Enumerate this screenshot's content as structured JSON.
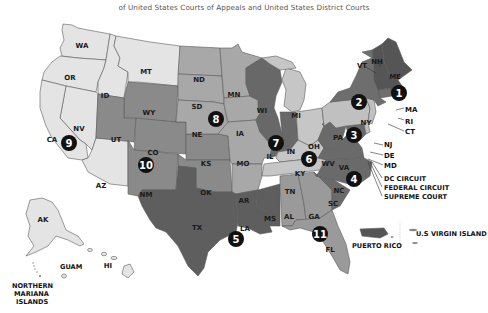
{
  "header": {
    "subtitle": "of United States Courts of Appeals and United States District Courts"
  },
  "colors": {
    "very_light": "#e4e4e4",
    "light": "#c6c6c6",
    "medium": "#9c9c9c",
    "medium_dark": "#7a7a7a",
    "dark": "#5c5c5c",
    "badge": "#111111"
  },
  "states": {
    "WA": "WA",
    "OR": "OR",
    "CA": "CA",
    "NV": "NV",
    "ID": "ID",
    "MT": "MT",
    "AZ": "AZ",
    "WY": "WY",
    "UT": "UT",
    "CO": "CO",
    "NM": "NM",
    "KS": "KS",
    "OK": "OK",
    "ND": "ND",
    "SD": "SD",
    "NE": "NE",
    "MN": "MN",
    "IA": "IA",
    "MO": "MO",
    "AR": "AR",
    "TX": "TX",
    "LA": "LA",
    "MS": "MS",
    "WI": "WI",
    "IL": "IL",
    "IN": "IN",
    "MI": "MI",
    "OH": "OH",
    "KY": "KY",
    "TN": "TN",
    "AL": "AL",
    "GA": "GA",
    "FL": "FL",
    "WV": "WV",
    "VA": "VA",
    "NC": "NC",
    "SC": "SC",
    "MD": "MD",
    "PA": "PA",
    "NJ": "NJ",
    "DE": "DE",
    "NY": "NY",
    "VT": "VT",
    "CT": "CT",
    "ME": "ME",
    "NH": "NH",
    "MA": "MA",
    "RI": "RI",
    "AK": "AK",
    "HI": "HI"
  },
  "territories": {
    "guam": "GUAM",
    "nmi_line1": "NORTHERN",
    "nmi_line2": "MARIANA",
    "nmi_line3": "ISLANDS",
    "puerto_rico": "PUERTO RICO",
    "usvi": "U.S VIRGIN ISLAND"
  },
  "special_courts": {
    "dc": "DC CIRCUIT",
    "federal": "FEDERAL CIRCUIT",
    "supreme": "SUPREME COURT"
  },
  "circuits": [
    {
      "number": "1"
    },
    {
      "number": "2"
    },
    {
      "number": "3"
    },
    {
      "number": "4"
    },
    {
      "number": "5"
    },
    {
      "number": "6"
    },
    {
      "number": "7"
    },
    {
      "number": "8"
    },
    {
      "number": "9"
    },
    {
      "number": "10"
    },
    {
      "number": "11"
    }
  ]
}
